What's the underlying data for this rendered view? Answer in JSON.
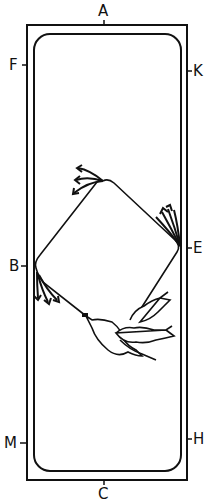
{
  "diagram": {
    "type": "dressage-arena",
    "colors": {
      "ink": "#111111",
      "background": "#ffffff"
    },
    "letters": {
      "A": "A",
      "K": "K",
      "E": "E",
      "H": "H",
      "C": "C",
      "M": "M",
      "B": "B",
      "F": "F"
    },
    "figures": [
      {
        "name": "track",
        "description": "rounded rectangular track inside arena"
      },
      {
        "name": "circle-path",
        "description": "large circle/diamond touching B and E"
      },
      {
        "name": "horse-silhouettes",
        "count": 3,
        "description": "stylised horses leaving the circle towards E"
      }
    ]
  }
}
